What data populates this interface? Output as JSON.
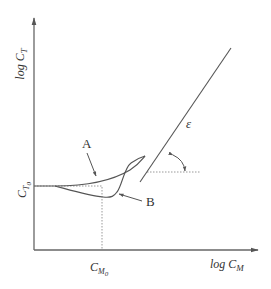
{
  "diagram": {
    "y_axis_label": {
      "main": "log C",
      "sub": "T"
    },
    "x_axis_label": {
      "main": "log C",
      "sub": "M"
    },
    "y_tick_label": {
      "main": "C",
      "sub": "T",
      "subsub": "0"
    },
    "x_tick_label": {
      "main": "C",
      "sub": "M",
      "subsub": "0"
    },
    "curve_labels": {
      "a": "A",
      "b": "B"
    },
    "angle_label": "ε",
    "colors": {
      "line": "#555555",
      "dotted": "#888888",
      "text": "#333333"
    }
  }
}
